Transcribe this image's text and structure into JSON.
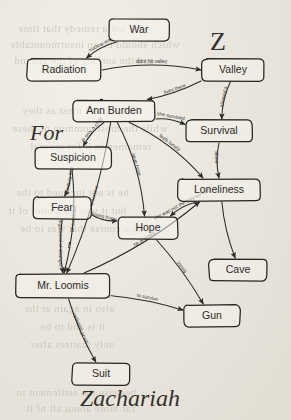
{
  "diagram": {
    "kind": "hand-drawn-concept-map",
    "ink_color": "#2a2926",
    "paper_color": "#e8e4dc",
    "title_words": {
      "z": "Z",
      "for": "For",
      "zachariah": "Zachariah"
    },
    "nodes": [
      {
        "id": "war",
        "label": "War",
        "x": 139,
        "y": 30,
        "w": 60,
        "h": 22
      },
      {
        "id": "radiation",
        "label": "Radiation",
        "x": 64,
        "y": 70,
        "w": 74,
        "h": 22
      },
      {
        "id": "valley",
        "label": "Valley",
        "x": 233,
        "y": 70,
        "w": 62,
        "h": 22
      },
      {
        "id": "annburden",
        "label": "Ann Burden",
        "x": 114,
        "y": 111,
        "w": 82,
        "h": 21
      },
      {
        "id": "survival",
        "label": "Survival",
        "x": 219,
        "y": 131,
        "w": 66,
        "h": 22
      },
      {
        "id": "suspicion",
        "label": "Suspicion",
        "x": 73,
        "y": 158,
        "w": 76,
        "h": 22
      },
      {
        "id": "loneliness",
        "label": "Loneliness",
        "x": 219,
        "y": 190,
        "w": 82,
        "h": 22
      },
      {
        "id": "fear",
        "label": "Fear",
        "x": 62,
        "y": 208,
        "w": 58,
        "h": 22
      },
      {
        "id": "hope",
        "label": "Hope",
        "x": 148,
        "y": 228,
        "w": 60,
        "h": 22
      },
      {
        "id": "cave",
        "label": "Cave",
        "x": 238,
        "y": 270,
        "w": 58,
        "h": 22
      },
      {
        "id": "loomis",
        "label": "Mr. Loomis",
        "x": 63,
        "y": 286,
        "w": 94,
        "h": 24
      },
      {
        "id": "gun",
        "label": "Gun",
        "x": 212,
        "y": 316,
        "w": 56,
        "h": 22
      },
      {
        "id": "suit",
        "label": "Suit",
        "x": 101,
        "y": 374,
        "w": 58,
        "h": 22
      }
    ],
    "edges": [
      {
        "id": "war-radiation",
        "from": "war",
        "to": "radiation",
        "label": "nuclear war"
      },
      {
        "id": "radiation-valley",
        "from": "radiation",
        "to": "valley",
        "label": "didnt hit valley"
      },
      {
        "id": "valley-annburden",
        "from": "valley",
        "to": "annburden",
        "label": "lives there"
      },
      {
        "id": "valley-survival",
        "from": "valley",
        "to": "survival",
        "label": "allowed a"
      },
      {
        "id": "annburden-survival",
        "from": "annburden",
        "to": "survival",
        "label": "she survived"
      },
      {
        "id": "annburden-loneliness",
        "from": "annburden",
        "to": "loneliness",
        "label": "feels lonely"
      },
      {
        "id": "annburden-hope",
        "from": "annburden",
        "to": "hope",
        "label": "gave hope"
      },
      {
        "id": "annburden-suspicion",
        "from": "annburden",
        "to": "suspicion",
        "label": "is only a child"
      },
      {
        "id": "annburden-loomis",
        "from": "annburden",
        "to": "loomis",
        "label": "to survive"
      },
      {
        "id": "suspicion-fear",
        "from": "suspicion",
        "to": "fear",
        "label": "leads to fear"
      },
      {
        "id": "suspicion-loomis",
        "from": "suspicion",
        "to": "loomis",
        "label": "of suspicion"
      },
      {
        "id": "fear-loomis",
        "from": "fear",
        "to": "loomis",
        "label": "frightened of stranger"
      },
      {
        "id": "fear-hope",
        "from": "fear",
        "to": "hope",
        "label": "losing hope"
      },
      {
        "id": "survival-loneliness",
        "from": "survival",
        "to": "loneliness",
        "label": "alone"
      },
      {
        "id": "loneliness-hope",
        "from": "loneliness",
        "to": "hope",
        "label": "she was not the only survivor"
      },
      {
        "id": "loneliness-cave",
        "from": "loneliness",
        "to": "cave",
        "label": ""
      },
      {
        "id": "loomis-loneliness",
        "from": "loomis",
        "to": "loneliness",
        "label": "he is lonely"
      },
      {
        "id": "loomis-gun",
        "from": "loomis",
        "to": "gun",
        "label": "to survive"
      },
      {
        "id": "loomis-suit",
        "from": "loomis",
        "to": "suit",
        "label": "radiation proof"
      },
      {
        "id": "hope-gun",
        "from": "hope",
        "to": "gun",
        "label": "lonely"
      }
    ],
    "ghost_text": [
      {
        "t": "are not a remedy that time",
        "x": 18,
        "y": 22
      },
      {
        "t": "which should be an insurmountable",
        "x": 10,
        "y": 38
      },
      {
        "t": "and the surface of the ground",
        "x": 14,
        "y": 54
      },
      {
        "t": "that matters most as they",
        "x": 22,
        "y": 104
      },
      {
        "t": "while the most common of these",
        "x": 12,
        "y": 122
      },
      {
        "t": "remained in it for several",
        "x": 30,
        "y": 140
      },
      {
        "t": "he is not inclined to the",
        "x": 16,
        "y": 186
      },
      {
        "t": "but it was the better of it",
        "x": 8,
        "y": 204
      },
      {
        "t": "on a course that was to be",
        "x": 20,
        "y": 222
      },
      {
        "t": "also in again at the",
        "x": 24,
        "y": 302
      },
      {
        "t": "it is and to be",
        "x": 40,
        "y": 320
      },
      {
        "t": "only matters after",
        "x": 30,
        "y": 338
      },
      {
        "t": "because the settlement to",
        "x": 16,
        "y": 386
      },
      {
        "t": "far more about all of it",
        "x": 26,
        "y": 402
      }
    ]
  }
}
